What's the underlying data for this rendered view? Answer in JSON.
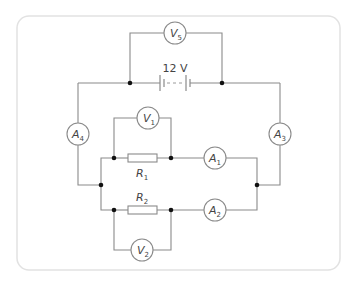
{
  "diagram": {
    "type": "circuit",
    "battery": {
      "label": "12 V"
    },
    "voltmeters": [
      {
        "id": "V5",
        "letter": "V",
        "sub": "5"
      },
      {
        "id": "V1",
        "letter": "V",
        "sub": "1"
      },
      {
        "id": "V2",
        "letter": "V",
        "sub": "2"
      }
    ],
    "ammeters": [
      {
        "id": "A4",
        "letter": "A",
        "sub": "4"
      },
      {
        "id": "A3",
        "letter": "A",
        "sub": "3"
      },
      {
        "id": "A1",
        "letter": "A",
        "sub": "1"
      },
      {
        "id": "A2",
        "letter": "A",
        "sub": "2"
      }
    ],
    "resistors": [
      {
        "id": "R1",
        "letter": "R",
        "sub": "1"
      },
      {
        "id": "R2",
        "letter": "R",
        "sub": "2"
      }
    ],
    "colors": {
      "wire": "#8a8a8a",
      "junction": "#111111",
      "frame": "#e2e2e2"
    }
  }
}
